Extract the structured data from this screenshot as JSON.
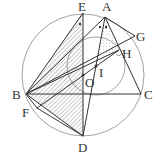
{
  "diagram": {
    "type": "geometry",
    "points": {
      "A": {
        "label": "A",
        "x": 105,
        "y": 17,
        "lx": 102,
        "ly": 11
      },
      "B": {
        "label": "B",
        "x": 26,
        "y": 94,
        "lx": 12,
        "ly": 99
      },
      "C": {
        "label": "C",
        "x": 141,
        "y": 94,
        "lx": 144,
        "ly": 99
      },
      "D": {
        "label": "D",
        "x": 83,
        "y": 136,
        "lx": 78,
        "ly": 152
      },
      "E": {
        "label": "E",
        "x": 83,
        "y": 13,
        "lx": 78,
        "ly": 11
      },
      "F": {
        "label": "F",
        "x": 37,
        "y": 108,
        "lx": 22,
        "ly": 117
      },
      "G": {
        "label": "G",
        "x": 135,
        "y": 36,
        "lx": 136,
        "ly": 41
      },
      "H": {
        "label": "H",
        "x": 119,
        "y": 50,
        "lx": 122,
        "ly": 58
      },
      "I": {
        "label": "I",
        "x": 96,
        "y": 66,
        "lx": 99,
        "ly": 77
      },
      "O": {
        "label": "O",
        "x": 83,
        "y": 75,
        "lx": 85,
        "ly": 87
      }
    },
    "circumcircle": {
      "cx": 83,
      "cy": 75,
      "r": 61
    },
    "incircle": {
      "cx": 96,
      "cy": 66,
      "r": 29
    },
    "colors": {
      "line": "#333333",
      "circle": "#999999",
      "hatch": "#666666"
    }
  }
}
